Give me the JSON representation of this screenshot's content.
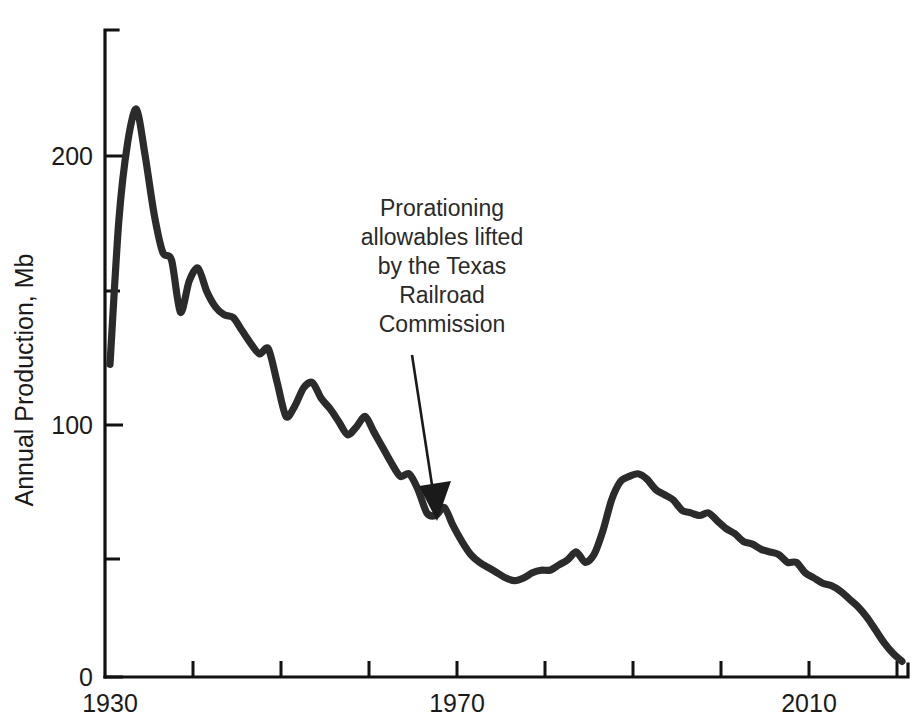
{
  "chart_data": {
    "type": "line",
    "title": "",
    "xlabel": "",
    "ylabel": "Annual Production, Mb",
    "xlim": [
      1930,
      2021
    ],
    "ylim": [
      0,
      250
    ],
    "grid": false,
    "legend": "none",
    "x_tick_labels": [
      "1930",
      "1970",
      "2010"
    ],
    "x_tick_values": [
      1930,
      1970,
      2010
    ],
    "x_minor_ticks": [
      1940,
      1950,
      1960,
      1980,
      1990,
      2000,
      2020
    ],
    "y_tick_labels": [
      "0",
      "100",
      "200"
    ],
    "y_tick_values": [
      0,
      100,
      200
    ],
    "y_minor_ticks": [
      50,
      150
    ],
    "series": [
      {
        "name": "Annual Production",
        "color": "#2b2b2b",
        "x": [
          1930,
          1931,
          1932,
          1933,
          1934,
          1935,
          1936,
          1937,
          1938,
          1939,
          1940,
          1941,
          1942,
          1943,
          1944,
          1945,
          1946,
          1947,
          1948,
          1949,
          1950,
          1951,
          1952,
          1953,
          1954,
          1955,
          1956,
          1957,
          1958,
          1959,
          1960,
          1961,
          1962,
          1963,
          1964,
          1965,
          1966,
          1967,
          1968,
          1969,
          1970,
          1971,
          1972,
          1973,
          1974,
          1975,
          1976,
          1977,
          1978,
          1979,
          1980,
          1981,
          1982,
          1983,
          1984,
          1985,
          1986,
          1987,
          1988,
          1989,
          1990,
          1991,
          1992,
          1993,
          1994,
          1995,
          1996,
          1997,
          1998,
          1999,
          2000,
          2001,
          2002,
          2003,
          2004,
          2005,
          2006,
          2007,
          2008,
          2009,
          2010,
          2011,
          2012,
          2013,
          2014,
          2015,
          2016,
          2017,
          2018,
          2019,
          2020
        ],
        "y": [
          120,
          175,
          205,
          218,
          200,
          178,
          163,
          160,
          140,
          152,
          157,
          148,
          142,
          139,
          138,
          133,
          128,
          124,
          126,
          113,
          100,
          104,
          111,
          113,
          107,
          103,
          98,
          93,
          96,
          100,
          94,
          88,
          82,
          77,
          78,
          72,
          63,
          62,
          65,
          58,
          52,
          47,
          44,
          42,
          40,
          38,
          37,
          38,
          40,
          41,
          41,
          43,
          45,
          48,
          44,
          47,
          56,
          68,
          75,
          77,
          78,
          76,
          72,
          70,
          68,
          64,
          63,
          62,
          63,
          60,
          57,
          55,
          52,
          51,
          49,
          48,
          47,
          44,
          44,
          40,
          38,
          36,
          35,
          33,
          30,
          27,
          23,
          18,
          13,
          9,
          6
        ],
        "note": "traced from curve; Mb per year"
      }
    ],
    "annotations": [
      {
        "text_lines": [
          "Prorationing",
          "allowables lifted",
          "by the Texas",
          "Railroad",
          "Commission"
        ],
        "text_x": 1965,
        "text_y_top": 210,
        "arrow_from": [
          1965,
          172
        ],
        "arrow_to": [
          1969,
          58
        ]
      }
    ]
  },
  "axis": {
    "y_title": "Annual Production, Mb"
  }
}
